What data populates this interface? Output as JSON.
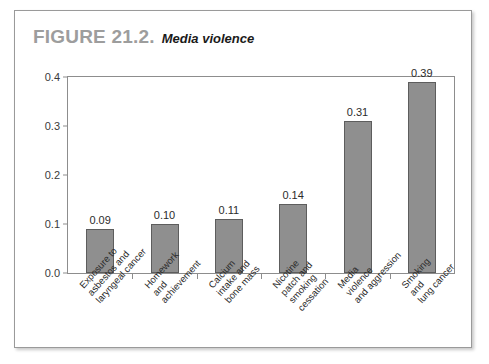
{
  "figure": {
    "number": "FIGURE 21.2.",
    "title": "Media violence"
  },
  "chart_data": {
    "type": "bar",
    "title": "Media violence",
    "xlabel": "",
    "ylabel": "",
    "ylim": [
      0.0,
      0.4
    ],
    "yticks": [
      "0.0",
      "0.1",
      "0.2",
      "0.3",
      "0.4"
    ],
    "ytick_values": [
      0.0,
      0.1,
      0.2,
      0.3,
      0.4
    ],
    "grid": false,
    "legend": "none",
    "bar_color": "#8f8f8f",
    "bar_edge_color": "#5d5d5d",
    "categories": [
      "Exposure to asbestos and laryngeal cancer",
      "Homework and achievement",
      "Calcium intake and bone mass",
      "Nicotine patch and smoking cessation",
      "Media violence and aggression",
      "Smoking and lung cancer"
    ],
    "category_lines": [
      [
        "Exposure to",
        "asbestos and",
        "laryngeal cancer"
      ],
      [
        "Homework",
        "and",
        "achievement"
      ],
      [
        "Calcium",
        "intake and",
        "bone mass"
      ],
      [
        "Nicotine",
        "patch and",
        "smoking",
        "cessation"
      ],
      [
        "Media",
        "violence",
        "and aggression"
      ],
      [
        "Smoking",
        "and",
        "lung cancer"
      ]
    ],
    "values": [
      0.09,
      0.1,
      0.11,
      0.14,
      0.31,
      0.39
    ],
    "value_labels": [
      "0.09",
      "0.10",
      "0.11",
      "0.14",
      "0.31",
      "0.39"
    ]
  }
}
